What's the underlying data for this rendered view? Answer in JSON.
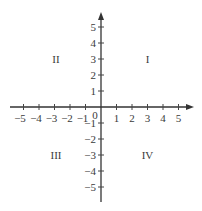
{
  "diagram": {
    "type": "cartesian-coordinate-plane",
    "colors": {
      "axis": "#333333",
      "text": "#3a3a3a",
      "background": "#ffffff"
    },
    "origin_label": "0",
    "x_axis": {
      "ticks": [
        -5,
        -4,
        -3,
        -2,
        -1,
        1,
        2,
        3,
        4,
        5
      ],
      "labels": [
        "−5",
        "−4",
        "−3",
        "−2",
        "−1",
        "1",
        "2",
        "3",
        "4",
        "5"
      ],
      "arrow": "right"
    },
    "y_axis": {
      "ticks": [
        5,
        4,
        3,
        2,
        1,
        -1,
        -2,
        -3,
        -4,
        -5
      ],
      "labels": [
        "5",
        "4",
        "3",
        "2",
        "1",
        "−1",
        "−2",
        "−3",
        "−4",
        "−5"
      ],
      "arrow": "up"
    },
    "quadrants": {
      "I": "I",
      "II": "II",
      "III": "III",
      "IV": "IV"
    }
  }
}
